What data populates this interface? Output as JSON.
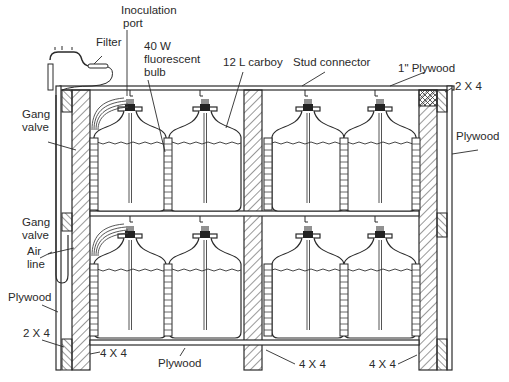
{
  "diagram": {
    "type": "cross-section",
    "labels": {
      "inoculation_port": [
        "Inoculation",
        "port"
      ],
      "filter": "Filter",
      "bulb": [
        "40 W",
        "fluorescent",
        "bulb"
      ],
      "carboy": "12 L carboy",
      "stud_connector": "Stud connector",
      "top_plywood": "1\" Plywood",
      "top_right_2x4": "2 X 4",
      "right_plywood": "Plywood",
      "gang_valve_top": [
        "Gang",
        "valve"
      ],
      "gang_valve_bottom": [
        "Gang",
        "valve"
      ],
      "air_line": [
        "Air",
        "line"
      ],
      "left_plywood": "Plywood",
      "bottom_left_2x4": "2 X 4",
      "bottom_left_4x4": "4 X 4",
      "bottom_plywood": "Plywood",
      "bottom_mid_4x4": "4 X 4",
      "bottom_right_4x4": "4 X 4"
    },
    "carboy_count": 8,
    "shelves": 2,
    "colors": {
      "line": "#2a2a2a",
      "background": "#ffffff"
    }
  }
}
